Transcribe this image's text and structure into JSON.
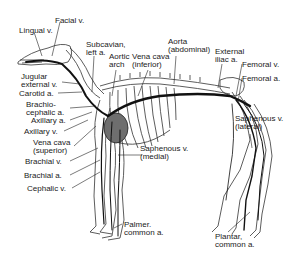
{
  "diagram": {
    "colors": {
      "line": "#1a1a1a",
      "heart": "#6e6e6e",
      "vessel": "#111111",
      "bone": "#555555"
    },
    "labels": [
      {
        "id": "facial-v",
        "text": "Facial v.",
        "x": 55,
        "y": 17
      },
      {
        "id": "lingual-v",
        "text": "Lingual v.",
        "x": 19,
        "y": 27
      },
      {
        "id": "subclavian-left-a",
        "text": "Subcavian,\nleft a.",
        "x": 86,
        "y": 41
      },
      {
        "id": "aortic-arch",
        "text": "Aortic\narch",
        "x": 109,
        "y": 53
      },
      {
        "id": "vena-cava-inferior",
        "text": "Vena cava\n(inferior)",
        "x": 132,
        "y": 53
      },
      {
        "id": "aorta-abdominal",
        "text": "Aorta\n(abdominal)",
        "x": 168,
        "y": 38
      },
      {
        "id": "external-iliac-a",
        "text": "External\niliac a.",
        "x": 215,
        "y": 48
      },
      {
        "id": "femoral-v",
        "text": "Femoral v.",
        "x": 242,
        "y": 61
      },
      {
        "id": "femoral-a",
        "text": "Femoral a.",
        "x": 242,
        "y": 75
      },
      {
        "id": "jugular-external-v",
        "text": "Jugular\nexternal v.",
        "x": 21,
        "y": 73
      },
      {
        "id": "carotid-a",
        "text": "Carotid a.",
        "x": 19,
        "y": 90
      },
      {
        "id": "brachiocephalic-a",
        "text": "Brachio-\ncephalic a.",
        "x": 26,
        "y": 101
      },
      {
        "id": "axillary-a",
        "text": "Axillary a.",
        "x": 31,
        "y": 117
      },
      {
        "id": "axillary-v",
        "text": "Axillary v.",
        "x": 24,
        "y": 128
      },
      {
        "id": "vena-cava-superior",
        "text": "Vena cava\n(superior)",
        "x": 33,
        "y": 139
      },
      {
        "id": "saphenous-v-lateral",
        "text": "Saphenous v.\n(lateral)",
        "x": 235,
        "y": 115
      },
      {
        "id": "saphenous-v-medial",
        "text": "Saphenous v.\n(medial)",
        "x": 140,
        "y": 145
      },
      {
        "id": "brachial-v",
        "text": "Brachial v.",
        "x": 25,
        "y": 158
      },
      {
        "id": "brachial-a",
        "text": "Brachial a.",
        "x": 24,
        "y": 172
      },
      {
        "id": "cephalic-v",
        "text": "Cephalic v.",
        "x": 27,
        "y": 185
      },
      {
        "id": "palmer-common-a",
        "text": "Palmer.\ncommon a.",
        "x": 124,
        "y": 221
      },
      {
        "id": "plantar-common-a",
        "text": "Plantar,\ncommon a.",
        "x": 215,
        "y": 233
      }
    ]
  }
}
